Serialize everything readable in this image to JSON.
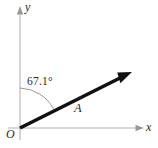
{
  "figure": {
    "type": "vector-diagram",
    "background_color": "#ffffff",
    "axes": {
      "x_label": "x",
      "y_label": "y",
      "origin_label": "O",
      "color": "#b3b3b3"
    },
    "vector": {
      "label": "A",
      "notation": "arrow-overbar",
      "color": "#111111",
      "tail": {
        "x": 20,
        "y": 128
      },
      "tip": {
        "x": 130,
        "y": 73
      }
    },
    "angle": {
      "value": "67.1",
      "unit": "°",
      "text": "67.1°",
      "measured_from": "y-axis",
      "arc_color": "#8c8c8c"
    }
  }
}
